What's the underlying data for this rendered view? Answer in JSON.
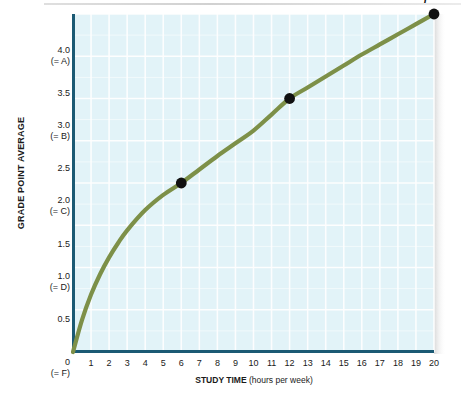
{
  "figure": {
    "background_color": "#ffffff",
    "plot_background_color": "#e2f3f8",
    "axis_color": "#1b5a74",
    "curve_color": "#7d9048",
    "gridline_color": "#ffffff",
    "point_color": "#111111"
  },
  "chart_data": {
    "type": "line",
    "title": "",
    "xlabel_main": "STUDY TIME",
    "xlabel_sub": "(hours per week)",
    "ylabel": "GRADE POINT AVERAGE",
    "xlim": [
      0,
      20
    ],
    "ylim": [
      0,
      4.0
    ],
    "grid": true,
    "legend": "none",
    "x_ticks": [
      "0",
      "1",
      "2",
      "3",
      "4",
      "5",
      "6",
      "7",
      "8",
      "9",
      "10",
      "11",
      "12",
      "13",
      "14",
      "15",
      "16",
      "17",
      "18",
      "19",
      "20"
    ],
    "x_tick_sublabels": [
      "(= F)",
      "",
      "",
      "",
      "",
      "",
      "",
      "",
      "",
      "",
      "",
      "",
      "",
      "",
      "",
      "",
      "",
      "",
      "",
      "",
      ""
    ],
    "y_ticks": [
      "4.0",
      "3.5",
      "3.0",
      "2.5",
      "2.0",
      "1.5",
      "1.0",
      "0.5",
      "0"
    ],
    "y_tick_values": [
      4.0,
      3.5,
      3.0,
      2.5,
      2.0,
      1.5,
      1.0,
      0.5,
      0
    ],
    "y_tick_sublabels": [
      "(= A)",
      "",
      "(= B)",
      "",
      "(= C)",
      "",
      "(= D)",
      "",
      "(= F)"
    ],
    "series": [
      {
        "name": "GPA vs study time",
        "x": [
          0,
          0.5,
          1,
          1.5,
          2,
          2.5,
          3,
          4,
          5,
          6,
          7,
          8,
          9,
          10,
          11,
          12,
          13,
          14,
          15,
          16,
          17,
          18,
          19,
          20
        ],
        "values": [
          0,
          0.38,
          0.68,
          0.92,
          1.12,
          1.29,
          1.44,
          1.68,
          1.86,
          2.0,
          2.16,
          2.32,
          2.47,
          2.62,
          2.81,
          3.0,
          3.13,
          3.26,
          3.39,
          3.52,
          3.64,
          3.76,
          3.88,
          4.0
        ]
      }
    ],
    "annotated_points": [
      {
        "label": "W",
        "x": 6,
        "y": 2.0
      },
      {
        "label": "X",
        "x": 12,
        "y": 3.0
      },
      {
        "label": "Y",
        "x": 20,
        "y": 4.0
      }
    ]
  }
}
